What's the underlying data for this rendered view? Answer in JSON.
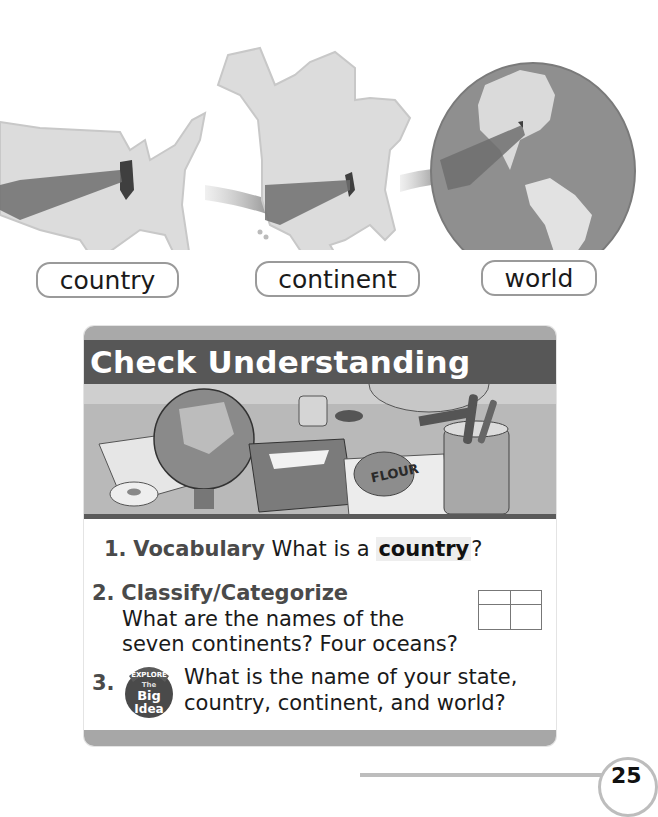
{
  "illustration": {
    "maps": [
      {
        "name": "united-states-map",
        "caption": "country"
      },
      {
        "name": "north-america-map",
        "caption": "continent"
      },
      {
        "name": "globe-map",
        "caption": "world"
      }
    ],
    "colors": {
      "land": "#dcdcdc",
      "ocean": "#8f8f8f",
      "arrow": "#6f6f6f",
      "highlight_state": "#3f3f3f"
    }
  },
  "labels": {
    "country": "country",
    "continent": "continent",
    "world": "world"
  },
  "check_understanding": {
    "title": "Check Understanding",
    "illustration_text": "FLOUR",
    "questions": [
      {
        "number": "1.",
        "term": "Vocabulary",
        "text_before": "What is a ",
        "vocab_word": "country",
        "text_after": "?"
      },
      {
        "number": "2.",
        "term": "Classify/Categorize",
        "line1": "What are the names of the",
        "line2": "seven continents? Four oceans?"
      },
      {
        "number": "3.",
        "badge": {
          "top": "EXPLORE",
          "mid": "The",
          "big": "Big",
          "bottom": "Idea"
        },
        "line1": "What is the name of your state,",
        "line2": "country, continent, and world?"
      }
    ],
    "colors": {
      "title_bar": "#575757",
      "frame": "#a9a9a9",
      "term_text": "#4a4a4a"
    }
  },
  "page": {
    "number": "25"
  }
}
